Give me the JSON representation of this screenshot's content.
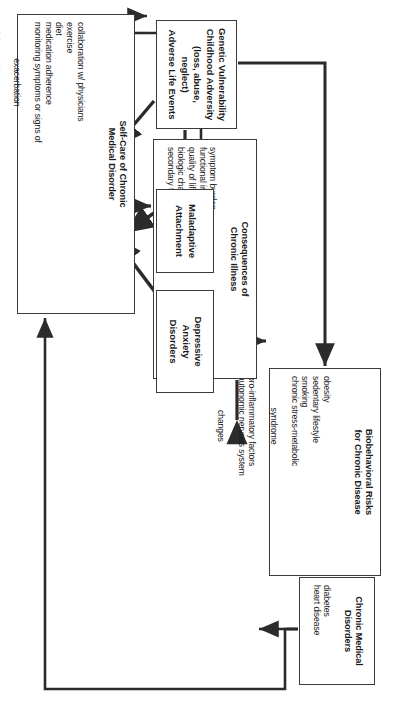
{
  "figure": {
    "rotation_note": "diagram rendered sideways (rotated 90 degrees)",
    "line_color": "#2b2b2b",
    "box_border_color": "#3a3a3a",
    "background_color": "#ffffff"
  },
  "nodes": {
    "chronic_medical_disorders": {
      "title": "Chronic Medical\nDisorders",
      "items": "diabetes\nheart disease"
    },
    "biobehavioral_risks": {
      "title": "Biobehavioral Risks\nfor Chronic Disease",
      "items_left": "obesity\nsedentary lifestyle\nsmoking\nchronic stress-metabolic",
      "items_center": "syndrome",
      "items_left2": "pro-inflammatory factors\nautonomic nervous system",
      "items_center2": "changes"
    },
    "consequences_chronic_illness": {
      "title": "Consequences of\nChronic Illness",
      "items": "symptom burden\nfunctional impairment\nquality of life\nbiologic changes in the brain\nsecondary to chronic illness"
    },
    "depressive_anxiety_disorders": {
      "title": "Depressive\nAnxiety\nDisorders"
    },
    "maladaptive_attachment": {
      "title": "Maladaptive\nAttachment"
    },
    "genetic_vulnerability": {
      "title": "Genetic Vulnerability\nChildhood Adversity\n(loss, abuse, neglect)\nAdverse Life Events"
    },
    "self_care": {
      "title": "Self-Care of Chronic\nMedical Disorder",
      "items_left": "collaboration w/ physicians\nexercise\ndiet\nmedication adherence\nmonitoring symptoms or signs of",
      "items_center": "exacerbation",
      "items_left2": "quitting smoking"
    }
  },
  "edges": [
    {
      "name": "biobehavioral-risks-to-chronic-medical-disorders",
      "from": "biobehavioral_risks",
      "to": "chronic_medical_disorders",
      "style": "single-arrow"
    },
    {
      "name": "depressive-anxiety-to-biobehavioral-risks",
      "from": "depressive_anxiety_disorders",
      "to": "biobehavioral_risks",
      "style": "single-arrow"
    },
    {
      "name": "maladaptive-attachment-to-depressive-anxiety",
      "from": "maladaptive_attachment",
      "to": "depressive_anxiety_disorders",
      "style": "single-arrow"
    },
    {
      "name": "genetic-vulnerability-to-maladaptive-attachment",
      "from": "genetic_vulnerability",
      "to": "maladaptive_attachment",
      "style": "single-arrow"
    },
    {
      "name": "genetic-vulnerability-to-self-care",
      "from": "genetic_vulnerability",
      "to": "self_care",
      "style": "single-arrow"
    },
    {
      "name": "genetic-vulnerability-to-biobehavioral-risks",
      "from": "genetic_vulnerability",
      "to": "biobehavioral_risks",
      "style": "routed-arrow"
    },
    {
      "name": "depressive-anxiety-to-consequences",
      "from": "depressive_anxiety_disorders",
      "to": "consequences_chronic_illness",
      "style": "double-arrow"
    },
    {
      "name": "depressive-anxiety-to-self-care",
      "from": "depressive_anxiety_disorders",
      "to": "self_care",
      "style": "single-arrow"
    },
    {
      "name": "maladaptive-attachment-to-self-care",
      "from": "maladaptive_attachment",
      "to": "self_care",
      "style": "single-arrow"
    },
    {
      "name": "self-care-to-consequences",
      "from": "self_care",
      "to": "consequences_chronic_illness",
      "style": "single-arrow"
    },
    {
      "name": "consequences-to-biobehavioral-risks",
      "from": "consequences_chronic_illness",
      "to": "biobehavioral_risks",
      "style": "single-arrow"
    },
    {
      "name": "chronic-medical-disorders-to-consequences",
      "from": "chronic_medical_disorders",
      "to": "consequences_chronic_illness",
      "style": "routed-arrow"
    },
    {
      "name": "chronic-medical-disorders-to-self-care",
      "from": "chronic_medical_disorders",
      "to": "self_care",
      "style": "routed-arrow"
    },
    {
      "name": "chronic-medical-disorders-to-depressive-anxiety",
      "from": "chronic_medical_disorders",
      "to": "depressive_anxiety_disorders",
      "style": "routed-arrow"
    }
  ]
}
